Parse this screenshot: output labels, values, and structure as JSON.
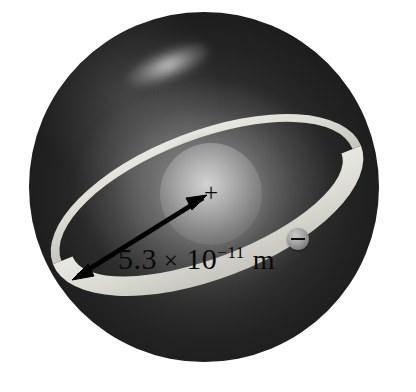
{
  "figure": {
    "kind": "bohr-model-atom-diagram",
    "background_color": "#ffffff"
  },
  "atom": {
    "sphere_label": "electron-cloud-sphere",
    "sphere_color_outer": "#191919",
    "sphere_color_inner": "#5e5e5e",
    "highlight_label": "specular-highlight"
  },
  "nucleus": {
    "label": "nucleus",
    "charge_sign": "+",
    "color": "#9a9a9a"
  },
  "electron": {
    "label": "electron",
    "charge_sign": "−",
    "color": "#9a9a9a"
  },
  "orbit": {
    "label": "electron-orbit-ring",
    "band_color": "#dcdcd4",
    "tilt_degrees": -21
  },
  "radius": {
    "measurement_label": "5.3 × 10⁻¹¹ m",
    "mantissa": "5.3",
    "multiplication_sign": "×",
    "base": "10",
    "exponent": "−11",
    "unit": "m",
    "arrow_style": "double-headed",
    "arrow_color": "#000000"
  }
}
